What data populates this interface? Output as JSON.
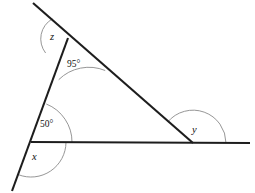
{
  "figure": {
    "type": "geometry-diagram",
    "background_color": "#ffffff",
    "line_color": "#1d1d1d",
    "arc_color": "#8a8a8a",
    "vertices": {
      "apex": {
        "x": 68,
        "y": 38
      },
      "bottom_left": {
        "x": 31,
        "y": 142
      },
      "bottom_right": {
        "x": 193,
        "y": 143
      }
    },
    "lines": [
      {
        "name": "transversal",
        "from": {
          "x": 33,
          "y": 3
        },
        "to": {
          "x": 193,
          "y": 143
        }
      },
      {
        "name": "left-line",
        "from": {
          "x": 68,
          "y": 38
        },
        "to": {
          "x": 12,
          "y": 191
        }
      },
      {
        "name": "horizontal-line",
        "from": {
          "x": 31,
          "y": 142
        },
        "to": {
          "x": 250,
          "y": 143
        }
      }
    ],
    "angles": [
      {
        "id": "z",
        "label": "z",
        "kind": "variable",
        "vertex": "apex",
        "position": {
          "x": 50,
          "y": 32
        }
      },
      {
        "id": "interior-apex",
        "label": "95°",
        "kind": "measure",
        "value": 95,
        "vertex": "apex",
        "position": {
          "x": 67,
          "y": 60
        }
      },
      {
        "id": "interior-bottom-left",
        "label": "50°",
        "kind": "measure",
        "value": 50,
        "vertex": "bottom_left",
        "position": {
          "x": 40,
          "y": 120
        }
      },
      {
        "id": "x",
        "label": "x",
        "kind": "variable",
        "vertex": "bottom_left",
        "position": {
          "x": 32,
          "y": 152
        }
      },
      {
        "id": "y",
        "label": "y",
        "kind": "variable",
        "vertex": "bottom_right",
        "position": {
          "x": 192,
          "y": 125
        }
      }
    ]
  }
}
